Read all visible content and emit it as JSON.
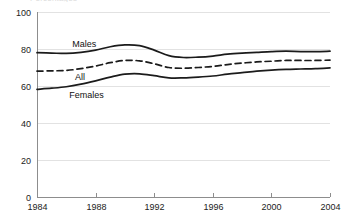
{
  "header": {
    "remnant_text": "Percentages"
  },
  "chart_data": {
    "type": "line",
    "title": "",
    "xlabel": "",
    "ylabel": "",
    "xlim": [
      1984,
      2004
    ],
    "ylim": [
      0,
      100
    ],
    "grid": true,
    "legend_position": "inline-labels",
    "x_ticks": [
      "1984",
      "1988",
      "1992",
      "1996",
      "2000",
      "2004"
    ],
    "x_tick_values": [
      1984,
      1988,
      1992,
      1996,
      2000,
      2004
    ],
    "y_ticks": [
      "0",
      "20",
      "40",
      "60",
      "80",
      "100"
    ],
    "y_tick_values": [
      0,
      20,
      40,
      60,
      80,
      100
    ],
    "x": [
      1984,
      1985,
      1986,
      1987,
      1988,
      1989,
      1990,
      1991,
      1992,
      1993,
      1994,
      1995,
      1996,
      1997,
      1998,
      1999,
      2000,
      2001,
      2002,
      2003,
      2004
    ],
    "series": [
      {
        "name": "Males",
        "style": "solid",
        "color": "#1b1b1b",
        "label": "Males",
        "values": [
          78,
          77.8,
          77.6,
          78.2,
          79.4,
          81.2,
          82.2,
          81.8,
          79.4,
          76.4,
          75.4,
          75.6,
          76.2,
          77.2,
          77.8,
          78.2,
          78.6,
          78.8,
          78.6,
          78.6,
          78.8
        ]
      },
      {
        "name": "All",
        "style": "dashed",
        "color": "#1b1b1b",
        "label": "All",
        "values": [
          68,
          68.2,
          68.4,
          69.4,
          70.8,
          72.6,
          73.8,
          73.6,
          72,
          70,
          69.6,
          70,
          70.6,
          71.6,
          72.4,
          73,
          73.4,
          73.8,
          73.8,
          73.8,
          74
        ]
      },
      {
        "name": "Females",
        "style": "solid",
        "color": "#1b1b1b",
        "label": "Females",
        "values": [
          58.2,
          58.8,
          59.6,
          61,
          62.8,
          64.8,
          66.4,
          66.6,
          65.6,
          64.4,
          64.4,
          64.8,
          65.4,
          66.4,
          67.2,
          68,
          68.6,
          69,
          69.2,
          69.4,
          69.8
        ]
      }
    ],
    "colors": {
      "line": "#1b1b1b",
      "grid": "#e2e2e2",
      "axis": "#8d8d8d",
      "text": "#222222"
    }
  }
}
